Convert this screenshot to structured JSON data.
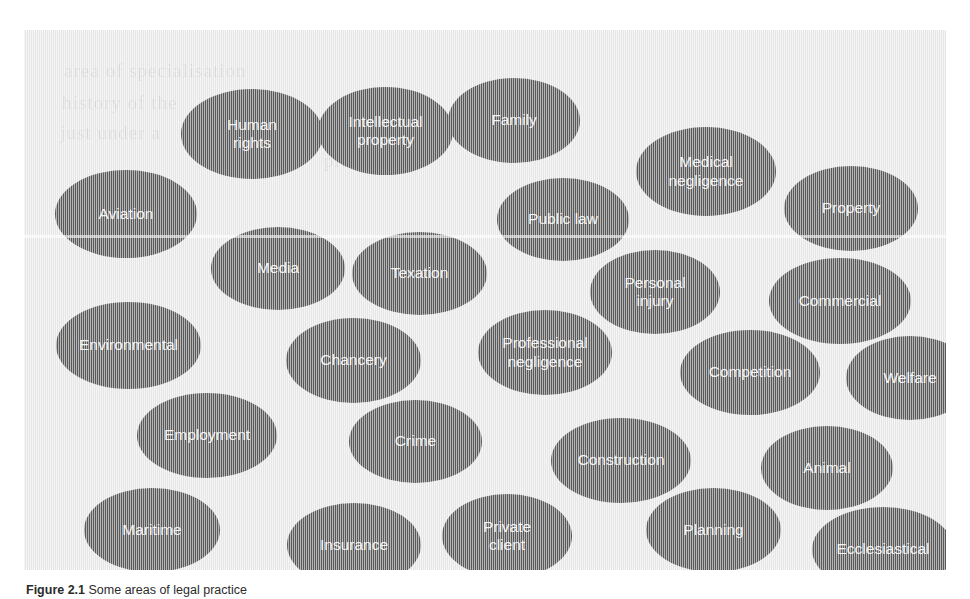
{
  "figure": {
    "background_color": "#eaeaea",
    "ellipse_color": "#5b5b5b",
    "ellipse_text_color": "#f4f4f4",
    "page_color": "#ffffff"
  },
  "caption": {
    "number": "Figure 2.1",
    "text": "Some areas of legal practice"
  },
  "ghost_text": [
    {
      "text": "area of specialisation",
      "x": 40,
      "y": 30
    },
    {
      "text": "history of the",
      "x": 38,
      "y": 62
    },
    {
      "text": "just under a",
      "x": 36,
      "y": 92
    },
    {
      "text": "practice",
      "x": 300,
      "y": 120
    }
  ],
  "chart_data": {
    "type": "bubble",
    "title": "Some areas of legal practice",
    "categories": [
      "Human rights",
      "Intellectual property",
      "Family",
      "Medical negligence",
      "Aviation",
      "Public law",
      "Property",
      "Media",
      "Texation",
      "Personal injury",
      "Commercial",
      "Environmental",
      "Chancery",
      "Professional negligence",
      "Competition",
      "Welfare",
      "Employment",
      "Crime",
      "Construction",
      "Animal",
      "Maritime",
      "Insurance",
      "Private client",
      "Planning",
      "Ecclesiastical"
    ],
    "xlabel": "",
    "ylabel": "",
    "legend": "none",
    "grid": false
  },
  "ellipses": [
    {
      "id": "human-rights",
      "label": "Human\nrights",
      "x": 157,
      "y": 59,
      "w": 142,
      "h": 90
    },
    {
      "id": "intellectual-property",
      "label": "Intellectual\nproperty",
      "x": 294,
      "y": 57,
      "w": 135,
      "h": 88
    },
    {
      "id": "family",
      "label": "Family",
      "x": 424,
      "y": 48,
      "w": 132,
      "h": 85
    },
    {
      "id": "medical-negligence",
      "label": "Medical\nnegligence",
      "x": 612,
      "y": 97,
      "w": 140,
      "h": 89
    },
    {
      "id": "aviation",
      "label": "Aviation",
      "x": 31,
      "y": 140,
      "w": 142,
      "h": 88
    },
    {
      "id": "public-law",
      "label": "Public law",
      "x": 473,
      "y": 148,
      "w": 132,
      "h": 83
    },
    {
      "id": "property",
      "label": "Property",
      "x": 760,
      "y": 136,
      "w": 134,
      "h": 85
    },
    {
      "id": "media",
      "label": "Media",
      "x": 187,
      "y": 197,
      "w": 134,
      "h": 83
    },
    {
      "id": "texation",
      "label": "Texation",
      "x": 328,
      "y": 202,
      "w": 135,
      "h": 83
    },
    {
      "id": "personal-injury",
      "label": "Personal\ninjury",
      "x": 566,
      "y": 220,
      "w": 130,
      "h": 84
    },
    {
      "id": "commercial",
      "label": "Commercial",
      "x": 745,
      "y": 228,
      "w": 142,
      "h": 86
    },
    {
      "id": "environmental",
      "label": "Environmental",
      "x": 32,
      "y": 272,
      "w": 145,
      "h": 87
    },
    {
      "id": "chancery",
      "label": "Chancery",
      "x": 262,
      "y": 288,
      "w": 135,
      "h": 85
    },
    {
      "id": "professional-negligence",
      "label": "Professional\nnegligence",
      "x": 454,
      "y": 280,
      "w": 134,
      "h": 85
    },
    {
      "id": "competition",
      "label": "Competition",
      "x": 656,
      "y": 300,
      "w": 140,
      "h": 85
    },
    {
      "id": "welfare",
      "label": "Welfare",
      "x": 822,
      "y": 306,
      "w": 128,
      "h": 84
    },
    {
      "id": "employment",
      "label": "Employment",
      "x": 113,
      "y": 363,
      "w": 140,
      "h": 85
    },
    {
      "id": "crime",
      "label": "Crime",
      "x": 325,
      "y": 370,
      "w": 133,
      "h": 83
    },
    {
      "id": "construction",
      "label": "Construction",
      "x": 527,
      "y": 388,
      "w": 140,
      "h": 85
    },
    {
      "id": "animal",
      "label": "Animal",
      "x": 737,
      "y": 396,
      "w": 132,
      "h": 84
    },
    {
      "id": "maritime",
      "label": "Maritime",
      "x": 60,
      "y": 458,
      "w": 136,
      "h": 84
    },
    {
      "id": "insurance",
      "label": "Insurance",
      "x": 263,
      "y": 473,
      "w": 134,
      "h": 84
    },
    {
      "id": "private-client",
      "label": "Private\nclient",
      "x": 418,
      "y": 464,
      "w": 130,
      "h": 84
    },
    {
      "id": "planning",
      "label": "Planning",
      "x": 622,
      "y": 458,
      "w": 135,
      "h": 84
    },
    {
      "id": "ecclesiastical",
      "label": "Ecclesiastical",
      "x": 788,
      "y": 477,
      "w": 142,
      "h": 85
    }
  ]
}
